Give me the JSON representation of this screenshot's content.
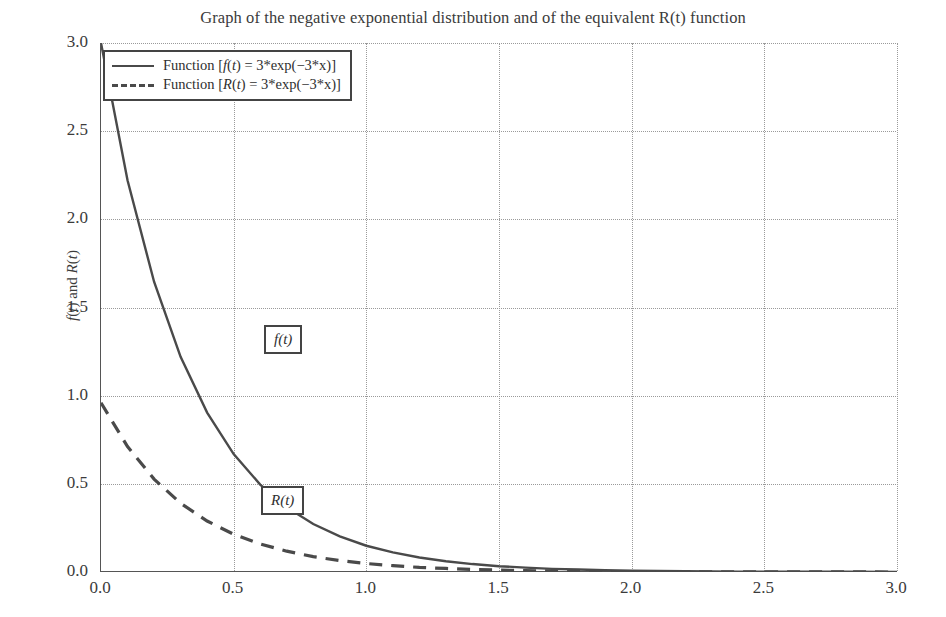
{
  "chart_data": {
    "type": "line",
    "title": "Graph of the negative exponential distribution and of the equivalent R(t) function",
    "xlabel": "",
    "ylabel": "f(t) and R(t)",
    "xlim": [
      0,
      3
    ],
    "ylim": [
      0,
      3
    ],
    "xticks": [
      "0.0",
      "0.5",
      "1.0",
      "1.5",
      "2.0",
      "2.5",
      "3.0"
    ],
    "xtick_values": [
      0,
      0.5,
      1.0,
      1.5,
      2.0,
      2.5,
      3.0
    ],
    "yticks": [
      "0.0",
      "0.5",
      "1.0",
      "1.5",
      "2.0",
      "2.5",
      "3.0"
    ],
    "ytick_values": [
      0,
      0.5,
      1.0,
      1.5,
      2.0,
      2.5,
      3.0
    ],
    "grid": true,
    "grid_style": "dotted",
    "legend_position": "upper left",
    "series": [
      {
        "name": "f(t)",
        "legend_label": "Function [f(t) = 3*exp(-3*x)]",
        "style": "solid",
        "color": "#4a4a4a",
        "x": [
          0,
          0.1,
          0.2,
          0.3,
          0.4,
          0.5,
          0.6,
          0.7,
          0.8,
          0.9,
          1.0,
          1.1,
          1.2,
          1.3,
          1.4,
          1.5,
          1.6,
          1.7,
          1.8,
          1.9,
          2.0,
          2.2,
          2.4,
          2.6,
          2.8,
          3.0
        ],
        "y": [
          3.0,
          2.222,
          1.646,
          1.22,
          0.904,
          0.669,
          0.496,
          0.367,
          0.272,
          0.202,
          0.149,
          0.111,
          0.082,
          0.061,
          0.045,
          0.033,
          0.025,
          0.018,
          0.014,
          0.01,
          0.007,
          0.004,
          0.002,
          0.001,
          0.001,
          0.0
        ]
      },
      {
        "name": "R(t)",
        "legend_label": "Function [R(t) = 3*exp(-3*x)]",
        "style": "dashed",
        "color": "#4a4a4a",
        "x": [
          0,
          0.1,
          0.2,
          0.3,
          0.4,
          0.5,
          0.6,
          0.7,
          0.8,
          0.9,
          1.0,
          1.1,
          1.2,
          1.3,
          1.4,
          1.5,
          1.6,
          1.8,
          2.0,
          2.5,
          3.0
        ],
        "y": [
          0.96,
          0.711,
          0.527,
          0.39,
          0.289,
          0.214,
          0.159,
          0.118,
          0.087,
          0.065,
          0.048,
          0.036,
          0.026,
          0.02,
          0.014,
          0.011,
          0.008,
          0.004,
          0.002,
          0.001,
          0.0
        ]
      }
    ],
    "annotations": [
      {
        "text": "f(t)",
        "x": 0.27,
        "y": 1.63
      },
      {
        "text": "R(t)",
        "x": 0.25,
        "y": 0.72
      }
    ]
  },
  "legend": {
    "entries": [
      {
        "label": "Function [f(t) = 3*exp(-3*x)]"
      },
      {
        "label": "Function [R(t) = 3*exp(-3*x)]"
      }
    ]
  },
  "colors": {
    "background": "#ffffff",
    "axis": "#555555",
    "grid": "#9a9a9a",
    "curve": "#4a4a4a",
    "text": "#3b3b3b"
  }
}
